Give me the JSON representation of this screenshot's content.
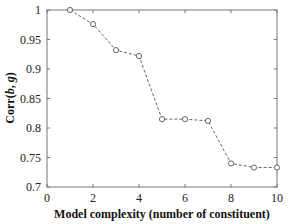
{
  "chart_data": {
    "type": "line",
    "title": "",
    "xlabel": "Model complexity (number of constituent)",
    "ylabel": "Corr(b, g)",
    "ylabel_parts": {
      "prefix": "Corr(",
      "var1": "b",
      "sep": ", ",
      "var2": "g",
      "suffix": ")"
    },
    "xlim": [
      0,
      10
    ],
    "ylim": [
      0.7,
      1
    ],
    "xticks": [
      0,
      2,
      4,
      6,
      8,
      10
    ],
    "yticks": [
      0.7,
      0.75,
      0.8,
      0.85,
      0.9,
      0.95,
      1
    ],
    "ytick_labels": [
      "0.7",
      "0.75",
      "0.8",
      "0.85",
      "0.9",
      "0.95",
      "1"
    ],
    "grid": false,
    "legend": null,
    "series": [
      {
        "name": "Corr(b,g)",
        "style": "dashed line with circle markers",
        "color": "#555555",
        "x": [
          1,
          2,
          3,
          4,
          5,
          6,
          7,
          8,
          9,
          10
        ],
        "y": [
          1.0,
          0.976,
          0.932,
          0.922,
          0.815,
          0.815,
          0.812,
          0.74,
          0.733,
          0.733
        ]
      }
    ]
  }
}
